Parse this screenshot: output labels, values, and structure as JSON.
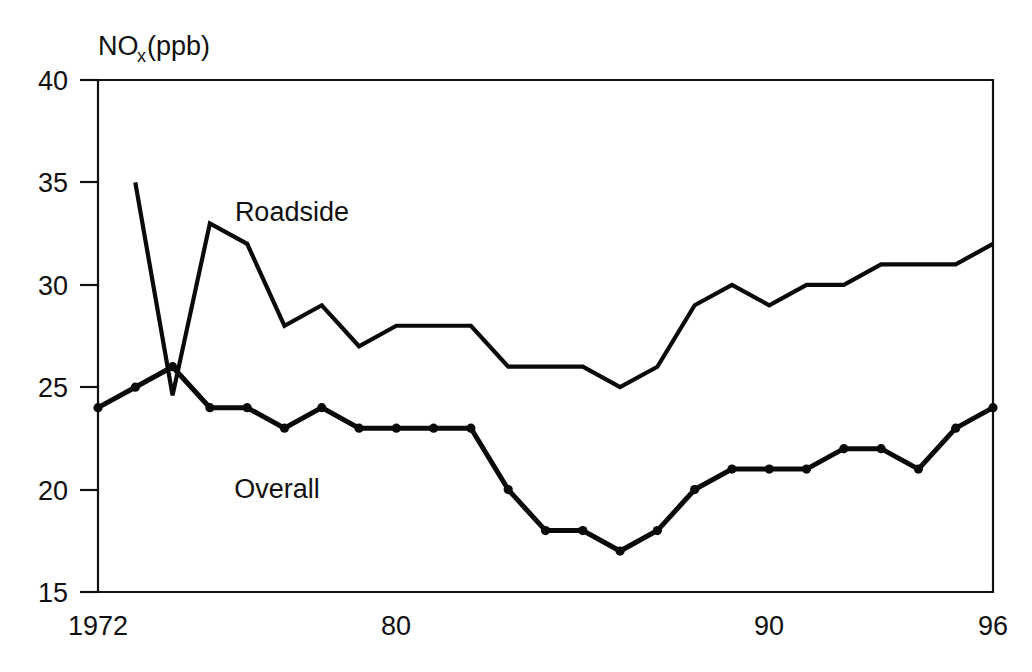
{
  "chart_data": {
    "type": "line",
    "title": "",
    "subtitle": "",
    "xlabel": "",
    "ylabel": "NOx (ppb)",
    "ylabel_main": "NO",
    "ylabel_sub": "x",
    "ylabel_unit": " (ppb)",
    "xlim": [
      1972,
      1996
    ],
    "ylim": [
      15,
      40
    ],
    "yticks": [
      15,
      20,
      25,
      30,
      35,
      40
    ],
    "ytick_labels": [
      "15",
      "20",
      "25",
      "30",
      "35",
      "40"
    ],
    "xticks": [
      1972,
      1980,
      1990,
      1996
    ],
    "xtick_labels": [
      "1972",
      "80",
      "90",
      "96"
    ],
    "grid": false,
    "legend_position": "inline-annotations",
    "annotations": [
      {
        "text": "Roadside",
        "x": 1977.2,
        "y": 33.1
      },
      {
        "text": "Overall",
        "x": 1976.8,
        "y": 19.6
      }
    ],
    "x": [
      1972,
      1973,
      1974,
      1975,
      1976,
      1977,
      1978,
      1979,
      1980,
      1981,
      1982,
      1983,
      1984,
      1985,
      1986,
      1987,
      1988,
      1989,
      1990,
      1991,
      1992,
      1993,
      1994,
      1995,
      1996
    ],
    "series": [
      {
        "name": "Roadside",
        "markers": false,
        "x": [
          1973,
          1974,
          1975,
          1976,
          1977,
          1978,
          1979,
          1980,
          1981,
          1982,
          1983,
          1984,
          1985,
          1986,
          1987,
          1988,
          1989,
          1990,
          1991,
          1992,
          1993,
          1994,
          1995,
          1996
        ],
        "values": [
          35,
          24.6,
          33,
          32,
          28,
          29,
          27,
          28,
          28,
          28,
          26,
          26,
          26,
          25,
          26,
          29,
          30,
          29,
          30,
          30,
          31,
          31,
          31,
          32
        ]
      },
      {
        "name": "Overall",
        "markers": true,
        "x": [
          1972,
          1973,
          1974,
          1975,
          1976,
          1977,
          1978,
          1979,
          1980,
          1981,
          1982,
          1983,
          1984,
          1985,
          1986,
          1987,
          1988,
          1989,
          1990,
          1991,
          1992,
          1993,
          1994,
          1995,
          1996
        ],
        "values": [
          24,
          25,
          26,
          24,
          24,
          23,
          24,
          23,
          23,
          23,
          23,
          20,
          18,
          18,
          17,
          18,
          20,
          21,
          21,
          21,
          22,
          22,
          21,
          23,
          24
        ]
      }
    ],
    "colors": {
      "line": "#0a0a0a",
      "axis": "#111111",
      "background": "#ffffff"
    }
  }
}
